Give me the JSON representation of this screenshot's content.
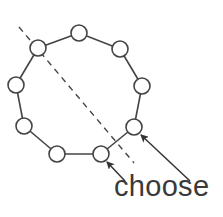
{
  "diagram": {
    "label": "choose",
    "colors": {
      "stroke": "#444444",
      "text": "#3a3a3a",
      "node_fill": "#ffffff",
      "background": "#ffffff"
    },
    "node_radius": 8,
    "nodes": [
      {
        "id": "n1",
        "x": 79,
        "y": 33
      },
      {
        "id": "n2",
        "x": 120,
        "y": 49
      },
      {
        "id": "n3",
        "x": 142,
        "y": 86
      },
      {
        "id": "n4",
        "x": 134,
        "y": 127
      },
      {
        "id": "n5",
        "x": 101,
        "y": 154
      },
      {
        "id": "n6",
        "x": 57,
        "y": 154
      },
      {
        "id": "n7",
        "x": 24,
        "y": 126
      },
      {
        "id": "n8",
        "x": 16,
        "y": 85
      },
      {
        "id": "n9",
        "x": 38,
        "y": 48
      }
    ],
    "edges": [
      [
        "n1",
        "n2"
      ],
      [
        "n2",
        "n3"
      ],
      [
        "n3",
        "n4"
      ],
      [
        "n4",
        "n5"
      ],
      [
        "n5",
        "n6"
      ],
      [
        "n6",
        "n7"
      ],
      [
        "n7",
        "n8"
      ],
      [
        "n8",
        "n9"
      ],
      [
        "n9",
        "n1"
      ]
    ],
    "dashed_line": {
      "x1": 19,
      "y1": 27,
      "x2": 134,
      "y2": 163
    },
    "arrows": [
      {
        "name": "arrow-to-bottom-right-node",
        "x1": 125,
        "y1": 181,
        "x2": 107,
        "y2": 162
      },
      {
        "name": "arrow-to-lower-right-node",
        "x1": 190,
        "y1": 181,
        "x2": 141,
        "y2": 135
      }
    ]
  }
}
